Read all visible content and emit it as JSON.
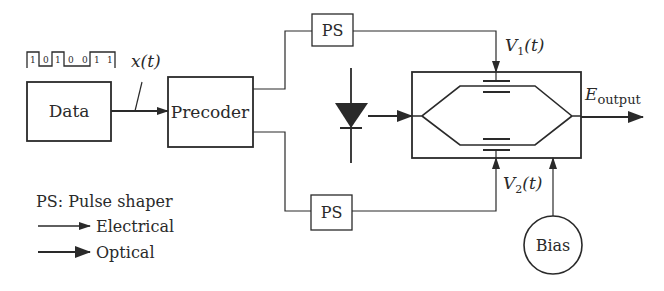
{
  "diagram": {
    "title": "",
    "bit_sequence": [
      "1",
      "0",
      "1",
      "0",
      "0",
      "1",
      "1"
    ],
    "signal_label": "x(t)",
    "blocks": {
      "data": "Data",
      "precoder": "Precoder",
      "ps_top": "PS",
      "ps_bottom": "PS",
      "bias": "Bias",
      "mzm": "Mach-Zehnder modulator"
    },
    "labels": {
      "v1_main": "V",
      "v1_sub": "1",
      "v1_suffix": "(t)",
      "v2_main": "V",
      "v2_sub": "2",
      "v2_suffix": "(t)",
      "eout_main": "E",
      "eout_sub": "output"
    },
    "legend": {
      "ps_def": "PS: Pulse shaper",
      "electrical": "Electrical",
      "optical": "Optical"
    },
    "icons": {
      "laser": "laser-diode-icon"
    },
    "colors": {
      "stroke": "#2a2a2a",
      "background": "#ffffff"
    }
  }
}
